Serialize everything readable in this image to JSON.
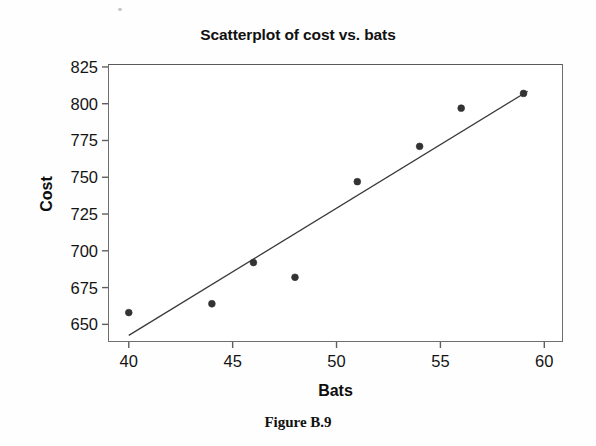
{
  "figure": {
    "caption": "Figure B.9"
  },
  "chart_data": {
    "type": "scatter",
    "title": "Scatterplot of cost vs. bats",
    "xlabel": "Bats",
    "ylabel": "Cost",
    "xlim": [
      39.0,
      60.9
    ],
    "ylim": [
      638.0,
      827.0
    ],
    "grid": false,
    "legend": null,
    "x_ticks": [
      40,
      45,
      50,
      55,
      60
    ],
    "x_tick_labels": [
      "40",
      "45",
      "50",
      "55",
      "60"
    ],
    "y_ticks": [
      650,
      675,
      700,
      725,
      750,
      775,
      800,
      825
    ],
    "y_tick_labels": [
      "650",
      "675",
      "700",
      "725",
      "750",
      "775",
      "800",
      "825"
    ],
    "points": [
      {
        "x": 40,
        "y": 658
      },
      {
        "x": 44,
        "y": 664
      },
      {
        "x": 46,
        "y": 692
      },
      {
        "x": 48,
        "y": 682
      },
      {
        "x": 51,
        "y": 747
      },
      {
        "x": 54,
        "y": 771
      },
      {
        "x": 56,
        "y": 797
      },
      {
        "x": 59,
        "y": 807
      }
    ],
    "marker": {
      "shape": "circle",
      "color": "#333333",
      "size": 6
    },
    "fit_line": {
      "type": "linear-regression",
      "color": "#3a3a3a",
      "x_start": 40.0,
      "y_start": 642.5,
      "x_end": 59.2,
      "y_end": 808.5
    }
  }
}
